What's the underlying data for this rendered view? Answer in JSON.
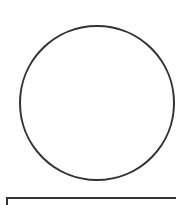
{
  "diagram": {
    "shapes": [
      {
        "type": "circle",
        "cx": 97,
        "cy": 103,
        "r": 77,
        "stroke": "#333333",
        "stroke_width": 2,
        "fill": "none"
      },
      {
        "type": "rectangle",
        "x": 7,
        "y": 198,
        "width": 175,
        "height": 20,
        "stroke": "#333333",
        "stroke_width": 2,
        "fill": "none"
      }
    ]
  }
}
